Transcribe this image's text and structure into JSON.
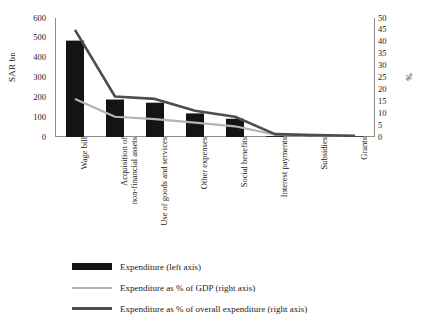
{
  "chart_data": {
    "type": "bar",
    "title": "",
    "subtitle": "",
    "xlabel": "",
    "ylabel": "SAR bn",
    "y2label": "%",
    "ylim": [
      0,
      600
    ],
    "y2lim": [
      0,
      50
    ],
    "grid": false,
    "legend_position": "bottom",
    "categories": [
      "Wage bill",
      "Acquisition of\nnon-financial assets",
      "Use of goods and services",
      "Other expenses",
      "Social benefits",
      "Interest payments",
      "Subsidies",
      "Grants"
    ],
    "left_ticks": [
      "0",
      "100",
      "200",
      "300",
      "400",
      "500",
      "600"
    ],
    "left_tick_values": [
      0,
      100,
      200,
      300,
      400,
      500,
      600
    ],
    "right_ticks": [
      "0",
      "5",
      "10",
      "15",
      "20",
      "25",
      "30",
      "35",
      "40",
      "45",
      "50"
    ],
    "right_tick_values": [
      0,
      5,
      10,
      15,
      20,
      25,
      30,
      35,
      40,
      45,
      50
    ],
    "series": [
      {
        "name": "Expenditure (left axis)",
        "kind": "bar",
        "axis": "left",
        "color": "#141414",
        "values": [
          486,
          189,
          173,
          119,
          92,
          4,
          2,
          1
        ]
      },
      {
        "name": "Expenditure as % of GDP (right axis)",
        "kind": "line",
        "axis": "right",
        "color": "#b3b3b3",
        "values": [
          16.0,
          8.5,
          7.5,
          6.0,
          4.5,
          1.0,
          0.6,
          0.4
        ]
      },
      {
        "name": "Expenditure as % of overall expenditure (right axis)",
        "kind": "line",
        "axis": "right",
        "color": "#4d4d4d",
        "values": [
          45.0,
          17.0,
          16.0,
          11.0,
          8.5,
          1.2,
          0.8,
          0.5
        ]
      }
    ]
  },
  "legend": {
    "items": [
      {
        "label": "Expenditure (left axis)",
        "marker": "bar-swatch",
        "color": "#141414"
      },
      {
        "label": "Expenditure as % of GDP (right axis)",
        "marker": "line-swatch",
        "color": "#b3b3b3"
      },
      {
        "label": "Expenditure as % of overall expenditure (right axis)",
        "marker": "line-swatch",
        "color": "#4d4d4d"
      }
    ]
  },
  "axes": {
    "left_title": "SAR bn",
    "right_title": "%"
  }
}
